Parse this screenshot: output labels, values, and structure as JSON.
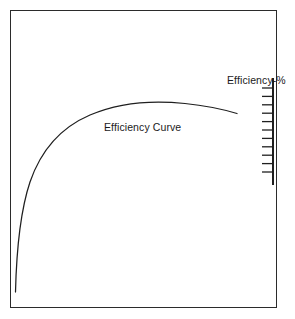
{
  "figure": {
    "background_color": "#ffffff",
    "stroke_color": "#1f1f1f",
    "frame_color": "#2b2b2b",
    "curve_label": "Efficiency Curve",
    "axis_title": "Efficiency-%"
  },
  "chart_data": {
    "type": "line",
    "title": "",
    "subtitle": "",
    "xlabel": "",
    "ylabel": "Efficiency-%",
    "grid": false,
    "legend_position": "none",
    "annotations": [
      {
        "text": "Efficiency Curve",
        "x": 0.42,
        "y": 0.6
      },
      {
        "text": "Efficiency-%",
        "x": 0.97,
        "y": 0.79
      }
    ],
    "axis": {
      "name": "Efficiency-%",
      "position": "right",
      "tick_count": 11,
      "tick_labels": [],
      "range_note": "unlabeled graduated scale"
    },
    "xlim": [
      0,
      1
    ],
    "ylim": [
      0,
      1
    ],
    "series": [
      {
        "name": "Efficiency Curve",
        "x": [
          0.02,
          0.035,
          0.06,
          0.095,
          0.14,
          0.2,
          0.27,
          0.35,
          0.43,
          0.51,
          0.59,
          0.66,
          0.72,
          0.78,
          0.83,
          0.87,
          0.9,
          0.93,
          0.96
        ],
        "values": [
          0.01,
          0.14,
          0.27,
          0.39,
          0.49,
          0.58,
          0.65,
          0.71,
          0.755,
          0.79,
          0.818,
          0.838,
          0.85,
          0.856,
          0.857,
          0.853,
          0.846,
          0.836,
          0.822
        ]
      }
    ]
  },
  "geometry": {
    "frame": {
      "x": 10,
      "y": 10,
      "width": 267,
      "height": 298
    },
    "curve_points": "M 15.5,292 C 16.5,250 20,212 30,182 C 41,150 62,127 90,115 C 118,103 152,100 185,103.5 C 205,105.5 222,109 237,113.5",
    "axis": {
      "x": 273,
      "y_top": 78,
      "y_bottom": 185
    },
    "ticks": {
      "x_right": 273,
      "x_left": 262,
      "y_start": 88,
      "y_step": 8.4,
      "count": 11
    }
  }
}
